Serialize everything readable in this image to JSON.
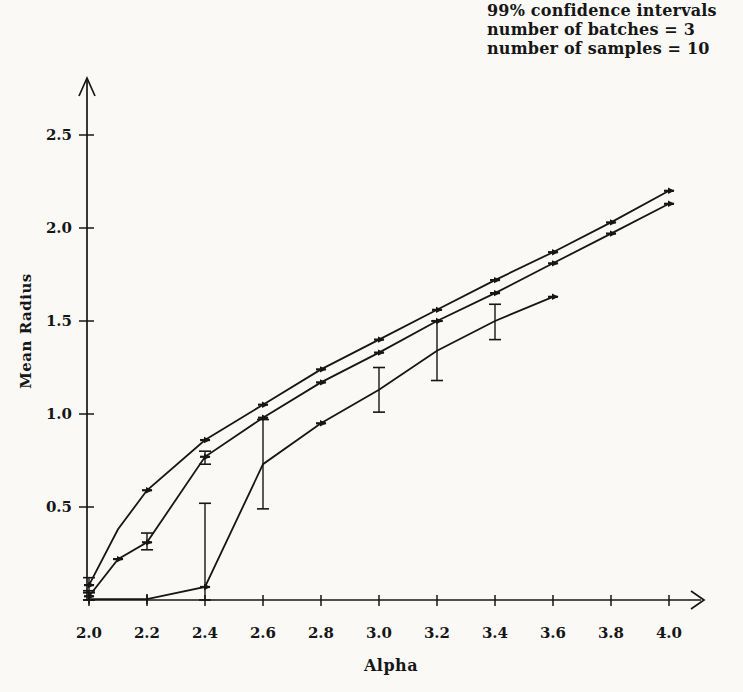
{
  "annotation": {
    "lines": [
      "99% confidence intervals",
      "number of batches = 3",
      "number of samples = 10"
    ]
  },
  "axes": {
    "x_label": "Alpha",
    "y_label": "Mean Radius"
  },
  "colors": {
    "ink": "#161616",
    "background": "#faf9f6"
  },
  "chart_data": {
    "type": "line",
    "title": "99% confidence intervals",
    "subtitle": "number of batches = 3, number of samples = 10",
    "xlabel": "Alpha",
    "ylabel": "Mean Radius",
    "xlim": [
      2.0,
      4.1
    ],
    "ylim": [
      0,
      2.75
    ],
    "x_ticks": [
      2.0,
      2.2,
      2.4,
      2.6,
      2.8,
      3.0,
      3.2,
      3.4,
      3.6,
      3.8,
      4.0
    ],
    "y_ticks": [
      0.5,
      1.0,
      1.5,
      2.0,
      2.5
    ],
    "grid": false,
    "legend": "none",
    "series": [
      {
        "name": "upper-curve",
        "points": [
          [
            2.0,
            0.08
          ],
          [
            2.1,
            0.38
          ],
          [
            2.2,
            0.59
          ],
          [
            2.4,
            0.86
          ],
          [
            2.6,
            1.05
          ],
          [
            2.8,
            1.24
          ],
          [
            3.0,
            1.4
          ],
          [
            3.2,
            1.56
          ],
          [
            3.4,
            1.72
          ],
          [
            3.6,
            1.87
          ],
          [
            3.8,
            2.03
          ],
          [
            4.0,
            2.2
          ]
        ],
        "marker_x": [
          2.0,
          2.2,
          2.4,
          2.6,
          2.8,
          3.0,
          3.2,
          3.4,
          3.6,
          3.8,
          4.0
        ],
        "error_bars": [
          {
            "x": 2.0,
            "lo": 0.04,
            "hi": 0.12
          }
        ]
      },
      {
        "name": "middle-curve",
        "points": [
          [
            2.0,
            0.02
          ],
          [
            2.1,
            0.22
          ],
          [
            2.2,
            0.31
          ],
          [
            2.4,
            0.77
          ],
          [
            2.6,
            0.98
          ],
          [
            2.8,
            1.17
          ],
          [
            3.0,
            1.33
          ],
          [
            3.2,
            1.5
          ],
          [
            3.4,
            1.65
          ],
          [
            3.6,
            1.81
          ],
          [
            3.8,
            1.97
          ],
          [
            4.0,
            2.13
          ]
        ],
        "marker_x": [
          2.0,
          2.1,
          2.2,
          2.4,
          2.6,
          2.8,
          3.0,
          3.2,
          3.4,
          3.6,
          3.8,
          4.0
        ],
        "error_bars": [
          {
            "x": 2.0,
            "lo": 0.0,
            "hi": 0.05
          },
          {
            "x": 2.2,
            "lo": 0.27,
            "hi": 0.36
          },
          {
            "x": 2.4,
            "lo": 0.73,
            "hi": 0.8
          }
        ]
      },
      {
        "name": "lower-curve",
        "points": [
          [
            2.0,
            0.005
          ],
          [
            2.2,
            0.005
          ],
          [
            2.4,
            0.07
          ],
          [
            2.6,
            0.73
          ],
          [
            2.8,
            0.95
          ],
          [
            3.0,
            1.13
          ],
          [
            3.2,
            1.34
          ],
          [
            3.4,
            1.5
          ],
          [
            3.6,
            1.63
          ]
        ],
        "marker_x": [
          2.4,
          2.8,
          3.6
        ],
        "tick_marker_x": [
          2.0,
          2.2
        ],
        "error_bars": [
          {
            "x": 2.0,
            "lo": 0.0,
            "hi": 0.04
          },
          {
            "x": 2.4,
            "lo": 0.0,
            "hi": 0.52
          },
          {
            "x": 2.6,
            "lo": 0.49,
            "hi": 0.97
          },
          {
            "x": 3.0,
            "lo": 1.01,
            "hi": 1.25
          },
          {
            "x": 3.2,
            "lo": 1.18,
            "hi": 1.5
          },
          {
            "x": 3.4,
            "lo": 1.4,
            "hi": 1.59
          }
        ]
      }
    ]
  }
}
